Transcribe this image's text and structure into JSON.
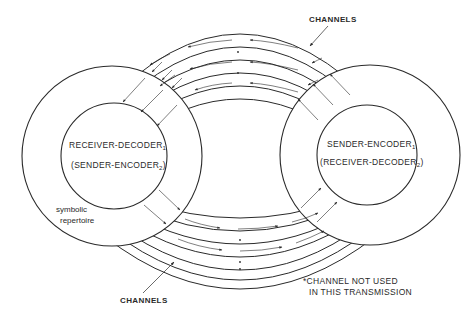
{
  "diagram": {
    "type": "communication-model",
    "left_node": {
      "line1": "RECEIVER-DECODER",
      "line1_sub": "1",
      "line2_prefix": "(SENDER-ENCODER",
      "line2_sub": "2",
      "line2_suffix": ")",
      "ring_label_line1": "symbolic",
      "ring_label_line2": "repertoire"
    },
    "right_node": {
      "line1": "SENDER-ENCODER",
      "line1_sub": "1",
      "line2_prefix": "(RECEIVER-DECODER",
      "line2_sub": "2",
      "line2_suffix": ")"
    },
    "top_channels": {
      "label": "CHANNELS",
      "count": 5,
      "direction": "right-to-left",
      "used": [
        true,
        false,
        true,
        false,
        true
      ]
    },
    "bottom_channels": {
      "label": "CHANNELS",
      "count": 6,
      "direction": "left-to-right",
      "used": [
        true,
        false,
        true,
        false,
        false,
        false
      ]
    },
    "footnote": {
      "line1": "*CHANNEL NOT USED",
      "line2": "IN THIS TRANSMISSION"
    },
    "colors": {
      "stroke": "#2a2a2a",
      "background": "#ffffff"
    }
  }
}
